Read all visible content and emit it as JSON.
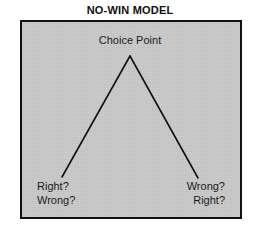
{
  "figure": {
    "title": "NO-WIN MODEL",
    "panel": {
      "background_color": "#c9c9c9",
      "border_color": "#111111"
    }
  },
  "diagram": {
    "type": "tree",
    "line_color": "#111111",
    "apex": {
      "label": "Choice Point"
    },
    "branches": [
      {
        "side": "left",
        "labels": [
          "Right?",
          "Wrong?"
        ]
      },
      {
        "side": "right",
        "labels": [
          "Wrong?",
          "Right?"
        ]
      }
    ]
  },
  "labels": {
    "choice_point": "Choice Point",
    "left_line_1": "Right?",
    "left_line_2": "Wrong?",
    "right_line_1": "Wrong?",
    "right_line_2": "Right?"
  }
}
